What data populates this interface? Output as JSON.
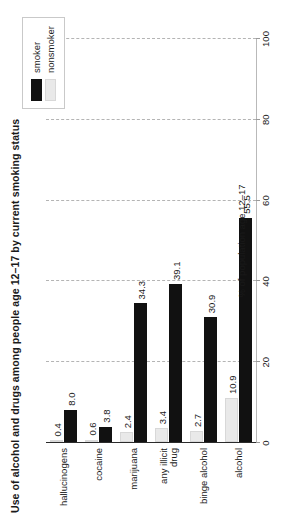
{
  "chart_data": {
    "type": "bar",
    "orientation": "horizontal",
    "title": "Use of alcohol and drugs among people age 12–17 by current smoking status",
    "xlabel": "% of population age 12–17",
    "ylabel": "",
    "xlim": [
      0,
      100
    ],
    "xticks": [
      0,
      20,
      40,
      60,
      80,
      100
    ],
    "xtick_labels": [
      "0",
      "20",
      "40",
      "60",
      "80",
      "100"
    ],
    "grid": true,
    "grid_axis": "x",
    "legend_position": "top-right",
    "categories": [
      "alcohol",
      "binge alcohol",
      "any illicit\ndrug",
      "marijuana",
      "cocaine",
      "hallucinogens"
    ],
    "series": [
      {
        "name": "smoker",
        "color": "#111111",
        "values": [
          55.5,
          30.9,
          39.1,
          34.3,
          3.8,
          8.0
        ],
        "labels": [
          "55.5",
          "30.9",
          "39.1",
          "34.3",
          "3.8",
          "8.0"
        ]
      },
      {
        "name": "nonsmoker",
        "color": "#e9e9e9",
        "values": [
          10.9,
          2.7,
          3.4,
          2.4,
          0.6,
          0.4
        ],
        "labels": [
          "10.9",
          "2.7",
          "3.4",
          "2.4",
          "0.6",
          "0.4"
        ]
      }
    ]
  },
  "legend": {
    "items": [
      {
        "label": "smoker",
        "color": "#111111"
      },
      {
        "label": "nonsmoker",
        "color": "#e9e9e9"
      }
    ]
  },
  "colors": {
    "smoker": "#111111",
    "nonsmoker": "#e9e9e9",
    "grid": "#b4b4b4",
    "axis": "#2b2b2b",
    "text": "#1a1a1a",
    "background": "#ffffff"
  }
}
